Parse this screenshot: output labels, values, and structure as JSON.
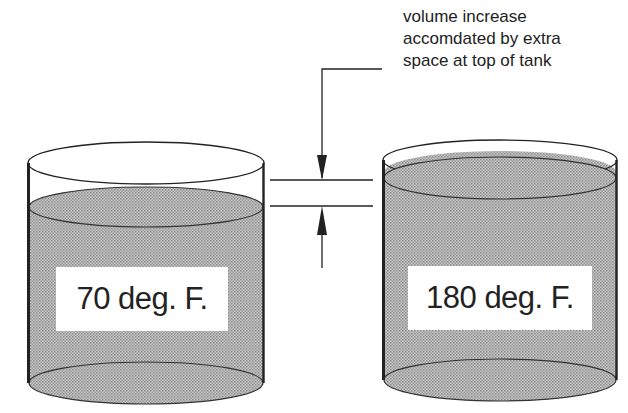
{
  "diagram": {
    "callout": {
      "lines": [
        "volume increase",
        "accomdated by extra",
        "space at top of tank"
      ]
    },
    "tanks": [
      {
        "id": "left",
        "label": "70 deg. F."
      },
      {
        "id": "right",
        "label": "180 deg. F."
      }
    ],
    "colors": {
      "line": "#222222",
      "liquid_fill": "#b4b4b4",
      "background": "#ffffff"
    }
  }
}
